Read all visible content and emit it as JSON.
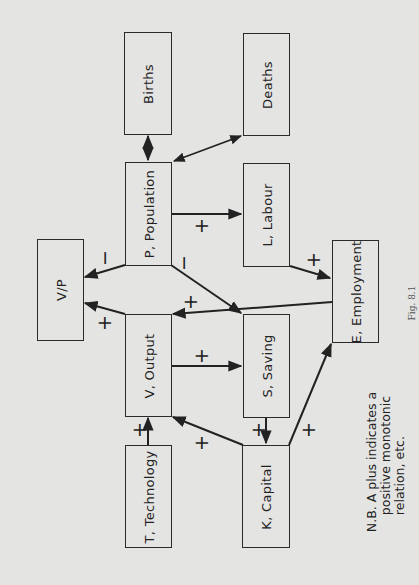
{
  "diagram": {
    "orientation": "rotated-90-ccw",
    "colors": {
      "background": "#e4e4e2",
      "line": "#222222"
    },
    "nodes": {
      "births": {
        "label": "Births"
      },
      "deaths": {
        "label": "Deaths"
      },
      "population": {
        "label": "P, Population"
      },
      "labour": {
        "label": "L, Labour"
      },
      "vp": {
        "label": "V/P"
      },
      "employment": {
        "label": "E, Employment"
      },
      "output": {
        "label": "V, Output"
      },
      "saving": {
        "label": "S, Saving"
      },
      "technology": {
        "label": "T, Technology"
      },
      "capital": {
        "label": "K, Capital"
      }
    },
    "edges": [
      {
        "from": "Births",
        "to": "P, Population",
        "type": "bidirectional",
        "sign": ""
      },
      {
        "from": "Deaths",
        "to": "P, Population",
        "type": "bidirectional",
        "sign": ""
      },
      {
        "from": "P, Population",
        "to": "L, Labour",
        "sign": "+"
      },
      {
        "from": "P, Population",
        "to": "V/P",
        "sign": "−"
      },
      {
        "from": "P, Population",
        "to": "S, Saving",
        "sign": "−"
      },
      {
        "from": "L, Labour",
        "to": "E, Employment",
        "sign": "+"
      },
      {
        "from": "E, Employment",
        "to": "V, Output",
        "sign": "+"
      },
      {
        "from": "V, Output",
        "to": "V/P",
        "sign": "+"
      },
      {
        "from": "V, Output",
        "to": "S, Saving",
        "sign": "+"
      },
      {
        "from": "T, Technology",
        "to": "V, Output",
        "sign": "+"
      },
      {
        "from": "K, Capital",
        "to": "V, Output",
        "sign": "+"
      },
      {
        "from": "S, Saving",
        "to": "K, Capital",
        "sign": "+"
      },
      {
        "from": "K, Capital",
        "to": "E, Employment",
        "sign": "+"
      }
    ],
    "signs": {
      "p_labour": "+",
      "p_vp": "−",
      "p_saving": "−",
      "labour_e": "+",
      "e_output": "+",
      "output_vp": "+",
      "output_saving": "+",
      "tech_output": "+",
      "capital_output": "+",
      "saving_capital": "+",
      "capital_e": "+"
    },
    "note": {
      "line1": "N.B. A plus indicates a",
      "line2": "positive monotonic",
      "line3": "relation, etc."
    },
    "figure_label": "Fig. 8.1"
  }
}
